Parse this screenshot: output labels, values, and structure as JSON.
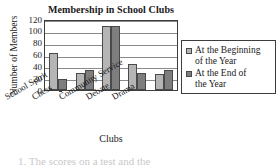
{
  "chart_data": {
    "type": "bar",
    "title": "Membership in School Clubs",
    "xlabel": "Clubs",
    "ylabel": "Number of Members",
    "categories": [
      "School Spirit",
      "Chess",
      "Community Service",
      "Debate",
      "Drama"
    ],
    "series": [
      {
        "name": "At the Beginning of the Year",
        "color": "#b5b5b5",
        "values": [
          62,
          28,
          109,
          44,
          27
        ]
      },
      {
        "name": "At the End of the Year",
        "color": "#7e7e7e",
        "values": [
          19,
          34,
          109,
          29,
          34
        ]
      }
    ],
    "ylim": [
      0,
      120
    ],
    "yticks": [
      0,
      20,
      40,
      60,
      80,
      100,
      120
    ],
    "ytick_labels": [
      "0",
      "20",
      "40",
      "60",
      "80",
      "100",
      "120"
    ],
    "grid": true,
    "legend_position": "right"
  },
  "legend": {
    "entries": [
      {
        "label_line1": "At the Beginning",
        "label_line2": "of the Year"
      },
      {
        "label_line1": "At the End of",
        "label_line2": "the Year"
      }
    ]
  },
  "page": {
    "bottom_text_fragment": "1.  The  scores  on  a  test  and  the"
  }
}
